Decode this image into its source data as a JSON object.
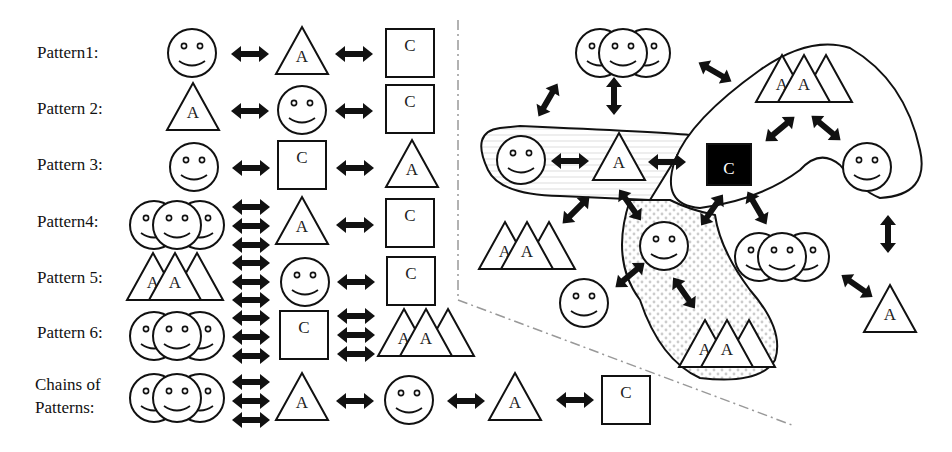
{
  "left_panel": {
    "labels": [
      "Pattern1:",
      "Pattern 2:",
      "Pattern 3:",
      "Pattern4:",
      "Pattern 5:",
      "Pattern 6:",
      "Chains of",
      "Patterns:"
    ]
  },
  "glyphs": {
    "agent_letter": "A",
    "content_letter": "C"
  },
  "legend_semantics": {
    "smiley": "user",
    "triangle": "agent (A)",
    "square": "content (C)",
    "arrow": "bidirectional interaction"
  },
  "colors": {
    "stroke": "#111111",
    "background": "#ffffff",
    "divider": "#999999",
    "highlight_fill": "#000000"
  }
}
